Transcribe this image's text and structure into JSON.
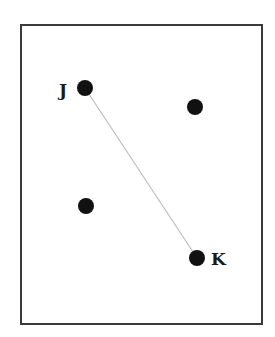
{
  "diagram": {
    "frame": {
      "x": 21,
      "y": 25,
      "width": 241,
      "height": 299,
      "stroke": "#3a3a3a"
    },
    "points": [
      {
        "id": "J",
        "label": "J",
        "cx": 85,
        "cy": 88,
        "r": 8,
        "label_x": 58,
        "label_y": 96
      },
      {
        "id": "P2",
        "label": "",
        "cx": 195,
        "cy": 107,
        "r": 8
      },
      {
        "id": "P3",
        "label": "",
        "cx": 86,
        "cy": 206,
        "r": 8
      },
      {
        "id": "K",
        "label": "K",
        "cx": 197,
        "cy": 258,
        "r": 8,
        "label_x": 211,
        "label_y": 265
      }
    ],
    "segments": [
      {
        "from": "J",
        "to": "K",
        "stroke": "#bdbdbd"
      }
    ],
    "dot_color": "#111111"
  }
}
